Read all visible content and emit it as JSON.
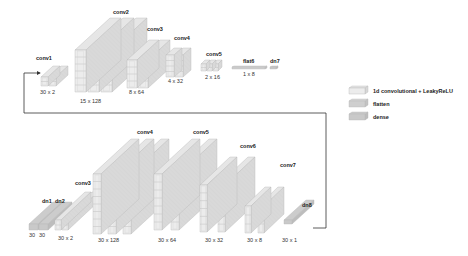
{
  "encoder": {
    "layers": [
      {
        "name": "conv1",
        "dims": "30 x 2",
        "type": "conv"
      },
      {
        "name": "conv2",
        "dims": "15 x 128",
        "type": "conv"
      },
      {
        "name": "conv3",
        "dims": "8 x 64",
        "type": "conv"
      },
      {
        "name": "conv4",
        "dims": "4 x 32",
        "type": "conv"
      },
      {
        "name": "conv5",
        "dims": "2 x 16",
        "type": "conv"
      },
      {
        "name": "flat6",
        "dims": "1 x 8",
        "type": "flatten"
      },
      {
        "name": "dn7",
        "dims": "",
        "type": "dense"
      }
    ]
  },
  "decoder": {
    "layers": [
      {
        "name": "dn1",
        "dims": "30",
        "type": "dense"
      },
      {
        "name": "dn2",
        "dims": "30",
        "type": "dense"
      },
      {
        "name": "conv3",
        "dims": "30 x 2",
        "type": "conv"
      },
      {
        "name": "conv4",
        "dims": "30 x 128",
        "type": "conv"
      },
      {
        "name": "conv5",
        "dims": "30 x 64",
        "type": "conv"
      },
      {
        "name": "conv6",
        "dims": "30 x 32",
        "type": "conv"
      },
      {
        "name": "conv7",
        "dims": "30 x 8",
        "type": "conv"
      },
      {
        "name": "dn8",
        "dims": "30 x 1",
        "type": "dense"
      }
    ]
  },
  "legend": [
    {
      "label": "1d convolutional + LeakyReLU",
      "type": "conv"
    },
    {
      "label": "flatten",
      "type": "flatten"
    },
    {
      "label": "dense",
      "type": "dense"
    }
  ],
  "colors": {
    "conv_front": "#ececec",
    "conv_side": "#d9d9d9",
    "conv_top": "#e6e6e6",
    "flatten": "#c4c4c4",
    "dense": "#bdbdbd",
    "stroke": "#b5b5b5",
    "connector": "#333333"
  }
}
